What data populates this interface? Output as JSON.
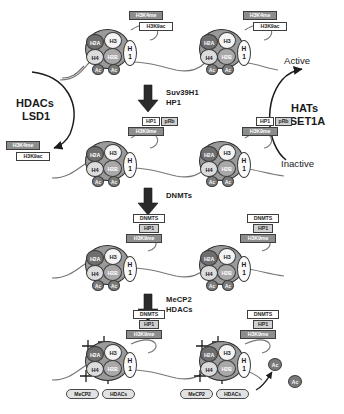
{
  "figure": {
    "marks": {
      "h3k4me": "H3K4me",
      "h3k9ac": "H3K9ac",
      "h3k9me": "H3K9me",
      "hp1": "HP1",
      "prb": "pRb",
      "dnmts_box": "DNMTS"
    },
    "histones": {
      "h2a": "H2A",
      "h3": "H3",
      "h4": "H4",
      "h2b": "H2B",
      "h1": "H\n1",
      "h1_line1": "H",
      "h1_line2": "1",
      "ac": "Ac"
    },
    "complexes": {
      "mecp2": "MeCP2",
      "hdacs_cap": "HDACs"
    },
    "enzymes": {
      "suv39h1": "Suv39H1",
      "hp1": "HP1",
      "dnmts": "DNMTs",
      "mecp2": "MeCP2",
      "hdacs": "HDACs"
    },
    "left_pathway": {
      "line1": "HDACs",
      "line2": "LSD1"
    },
    "right_pathway": {
      "line1": "HATs",
      "line2": "hSET1A"
    },
    "states": {
      "active": "Active",
      "inactive": "Inactive"
    },
    "colors": {
      "h2a": "#6e6e6e",
      "h3": "#f4f4f4",
      "h4": "#dcdcdc",
      "h2b": "#a8a8a8",
      "mark_gray": "#8d8d8d",
      "mark_white": "#ffffff",
      "dna": "#6b6b6b",
      "text": "#1a1a1a"
    }
  }
}
